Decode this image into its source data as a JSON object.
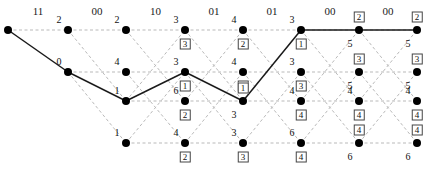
{
  "figure": {
    "type": "viterbi-trellis-diagram",
    "columns": 8,
    "rows": 4,
    "headers": [
      "11",
      "00",
      "10",
      "01",
      "01",
      "00",
      "00"
    ],
    "colors": {
      "node": "#000000",
      "survivor_path": "#1a1a1a",
      "candidate_path": "#b9b9b9"
    },
    "footer_text": ""
  },
  "chart_data": {
    "type": "diagram",
    "title": "",
    "xlabel": "",
    "ylabel": "",
    "stage_labels": [
      "11",
      "00",
      "10",
      "01",
      "01",
      "00",
      "00"
    ],
    "nodes": [
      {
        "col": 0,
        "row": 0,
        "metric": "",
        "boxed": "",
        "boxed_above": false
      },
      {
        "col": 1,
        "row": 0,
        "metric": "2",
        "boxed": "",
        "boxed_above": false
      },
      {
        "col": 1,
        "row": 1,
        "metric": "0",
        "boxed": "",
        "boxed_above": false
      },
      {
        "col": 2,
        "row": 0,
        "metric": "2",
        "boxed": "",
        "boxed_above": false
      },
      {
        "col": 2,
        "row": 1,
        "metric": "4",
        "boxed": "",
        "boxed_above": false
      },
      {
        "col": 2,
        "row": 2,
        "metric": "1",
        "boxed": "",
        "boxed_above": false
      },
      {
        "col": 2,
        "row": 3,
        "metric": "1",
        "boxed": "",
        "boxed_above": false
      },
      {
        "col": 3,
        "row": 0,
        "metric": "3",
        "boxed": "3",
        "boxed_above": false
      },
      {
        "col": 3,
        "row": 1,
        "metric": "3",
        "boxed": "1",
        "boxed_above": false
      },
      {
        "col": 3,
        "row": 2,
        "metric": "6",
        "boxed": "2",
        "boxed_above": false
      },
      {
        "col": 3,
        "row": 3,
        "metric": "4",
        "boxed": "2",
        "boxed_above": false
      },
      {
        "col": 4,
        "row": 0,
        "metric": "4",
        "boxed": "2",
        "boxed_above": false
      },
      {
        "col": 4,
        "row": 1,
        "metric": "4",
        "boxed": "4",
        "boxed_above": false
      },
      {
        "col": 4,
        "row": 2,
        "metric": "3",
        "boxed": "1",
        "boxed_above": true
      },
      {
        "col": 4,
        "row": 3,
        "metric": "3",
        "boxed": "3",
        "boxed_above": false
      },
      {
        "col": 5,
        "row": 0,
        "metric": "3",
        "boxed": "1",
        "boxed_above": false
      },
      {
        "col": 5,
        "row": 1,
        "metric": "3",
        "boxed": "3",
        "boxed_above": false
      },
      {
        "col": 5,
        "row": 2,
        "metric": "4",
        "boxed": "4",
        "boxed_above": false
      },
      {
        "col": 5,
        "row": 3,
        "metric": "6",
        "boxed": "4",
        "boxed_above": false
      },
      {
        "col": 6,
        "row": 0,
        "metric": "5",
        "boxed": "2",
        "boxed_above": true
      },
      {
        "col": 6,
        "row": 1,
        "metric": "5",
        "boxed": "3",
        "boxed_above": true
      },
      {
        "col": 6,
        "row": 2,
        "metric": "4",
        "boxed": "4",
        "boxed_above": false
      },
      {
        "col": 6,
        "row": 3,
        "metric": "6",
        "boxed": "4",
        "boxed_above": true
      },
      {
        "col": 7,
        "row": 0,
        "metric": "5",
        "boxed": "2",
        "boxed_above": true
      },
      {
        "col": 7,
        "row": 1,
        "metric": "5",
        "boxed": "3",
        "boxed_above": true
      },
      {
        "col": 7,
        "row": 2,
        "metric": "4",
        "boxed": "4",
        "boxed_above": false
      },
      {
        "col": 7,
        "row": 3,
        "metric": "6",
        "boxed": "4",
        "boxed_above": true
      }
    ],
    "survivor_path": [
      [
        0,
        0
      ],
      [
        1,
        1
      ],
      [
        2,
        2
      ],
      [
        3,
        1
      ],
      [
        4,
        2
      ],
      [
        5,
        0
      ],
      [
        6,
        0
      ],
      [
        7,
        0
      ]
    ],
    "candidate_edges": [
      [
        0,
        0,
        1,
        0
      ],
      [
        1,
        0,
        2,
        0
      ],
      [
        1,
        0,
        2,
        2
      ],
      [
        1,
        1,
        2,
        1
      ],
      [
        1,
        1,
        2,
        3
      ],
      [
        2,
        0,
        3,
        0
      ],
      [
        2,
        0,
        3,
        2
      ],
      [
        2,
        1,
        3,
        1
      ],
      [
        2,
        1,
        3,
        3
      ],
      [
        2,
        2,
        3,
        0
      ],
      [
        2,
        2,
        3,
        2
      ],
      [
        2,
        3,
        3,
        1
      ],
      [
        2,
        3,
        3,
        3
      ],
      [
        3,
        0,
        4,
        0
      ],
      [
        3,
        0,
        4,
        2
      ],
      [
        3,
        1,
        4,
        1
      ],
      [
        3,
        1,
        4,
        3
      ],
      [
        3,
        2,
        4,
        0
      ],
      [
        3,
        2,
        4,
        2
      ],
      [
        3,
        3,
        4,
        1
      ],
      [
        3,
        3,
        4,
        3
      ],
      [
        4,
        0,
        5,
        0
      ],
      [
        4,
        0,
        5,
        2
      ],
      [
        4,
        1,
        5,
        1
      ],
      [
        4,
        1,
        5,
        3
      ],
      [
        4,
        2,
        5,
        0
      ],
      [
        4,
        2,
        5,
        2
      ],
      [
        4,
        3,
        5,
        1
      ],
      [
        4,
        3,
        5,
        3
      ],
      [
        5,
        0,
        6,
        0
      ],
      [
        5,
        0,
        6,
        2
      ],
      [
        5,
        1,
        6,
        1
      ],
      [
        5,
        1,
        6,
        3
      ],
      [
        5,
        2,
        6,
        0
      ],
      [
        5,
        2,
        6,
        2
      ],
      [
        5,
        3,
        6,
        1
      ],
      [
        5,
        3,
        6,
        3
      ],
      [
        6,
        0,
        7,
        0
      ],
      [
        6,
        0,
        7,
        2
      ],
      [
        6,
        1,
        7,
        1
      ],
      [
        6,
        1,
        7,
        3
      ],
      [
        6,
        2,
        7,
        0
      ],
      [
        6,
        2,
        7,
        2
      ],
      [
        6,
        3,
        7,
        1
      ],
      [
        6,
        3,
        7,
        3
      ]
    ]
  }
}
